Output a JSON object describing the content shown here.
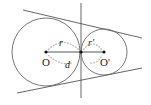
{
  "diagram": {
    "type": "two externally tangent circles with common tangents",
    "labels": {
      "center_left": "O",
      "center_right": "O'",
      "radius_left": "r",
      "radius_right": "r'",
      "distance": "d"
    },
    "colors": {
      "stroke": "#555555",
      "point": "#111111",
      "arc": "#bbbbbb",
      "text": "#222222"
    },
    "geometry": {
      "circle_left": {
        "cx": 45,
        "cy": 52,
        "r": 34
      },
      "circle_right": {
        "cx": 103,
        "cy": 52,
        "r": 23
      },
      "tangent_point": {
        "x": 80,
        "y": 52
      },
      "internal_tangent_x": 80
    }
  }
}
